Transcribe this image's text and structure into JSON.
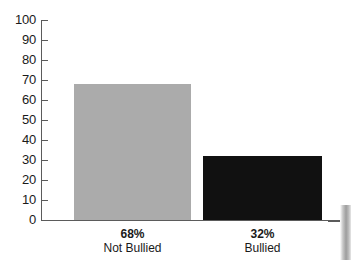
{
  "chart_data": {
    "type": "bar",
    "title": "",
    "subtitle": "",
    "xlabel": "",
    "ylabel": "",
    "categories": [
      "Not Bullied",
      "Bullied"
    ],
    "values": [
      68,
      32
    ],
    "value_labels": [
      "68%",
      "32%"
    ],
    "ylim": [
      0,
      100
    ],
    "y_ticks": [
      "100",
      "90",
      "80",
      "70",
      "60",
      "50",
      "40",
      "30",
      "20",
      "10",
      "0"
    ],
    "grid": false,
    "legend": "none",
    "series": [
      {
        "name": "Percent of students",
        "values": [
          68,
          32
        ]
      }
    ],
    "bar_colors": [
      "#ababab",
      "#111111"
    ]
  },
  "axis": {
    "line_color": "#5b5b5b",
    "tick_color": "#5b5b5b",
    "label_color": "#1a1a1a"
  },
  "canvas": {
    "background": "#ffffff"
  },
  "artifact": {
    "name": "page-edge-strip"
  }
}
